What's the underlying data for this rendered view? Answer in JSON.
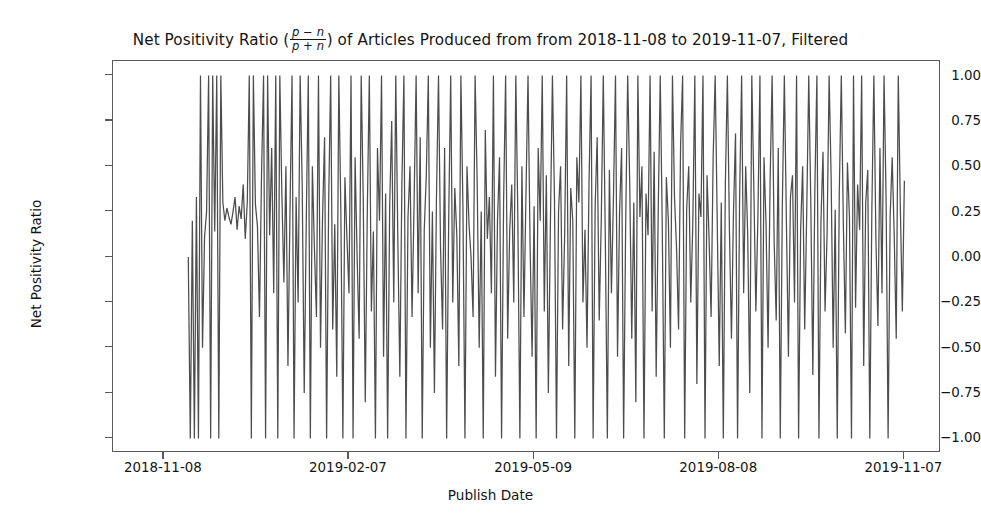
{
  "chart_data": {
    "type": "line",
    "title_prefix": "Net Positivity Ratio (",
    "title_fraction_numerator": "p − n",
    "title_fraction_denominator": "p + n",
    "title_suffix": ") of Articles Produced from from 2018-11-08 to 2019-11-07, Filtered",
    "xlabel": "Publish Date",
    "ylabel": "Net Positivity Ratio",
    "ylim": [
      -1.08,
      1.08
    ],
    "yticks": [
      1.0,
      0.75,
      0.5,
      0.25,
      0.0,
      -0.25,
      -0.5,
      -0.75,
      -1.0
    ],
    "ytick_labels": [
      "1.00",
      "0.75",
      "0.50",
      "0.25",
      "0.00",
      "−0.25",
      "−0.50",
      "−0.75",
      "−1.00"
    ],
    "xticks": [
      0,
      91,
      182,
      273,
      364
    ],
    "xtick_labels": [
      "2018-11-08",
      "2019-02-07",
      "2019-05-09",
      "2019-08-08",
      "2019-11-07"
    ],
    "x_start": "2018-11-08",
    "x_end": "2019-11-07",
    "xlim": [
      -25,
      382
    ],
    "n_points": 365,
    "grid": false,
    "legend": false,
    "line_color": "#4d4d4d",
    "line_width": 1.25,
    "background_color": "#ffffff",
    "axes_edge_color": "#5a5a5a",
    "leading_gap_days": 12,
    "trailing_gap_days": 10,
    "series_name": "Net Positivity Ratio",
    "values": [
      null,
      null,
      null,
      null,
      null,
      null,
      null,
      null,
      null,
      null,
      null,
      null,
      0.0,
      -1.0,
      0.2,
      -1.0,
      0.33,
      -1.0,
      1.0,
      -0.5,
      0.11,
      0.25,
      1.0,
      -1.0,
      1.0,
      0.14,
      1.0,
      -1.0,
      1.0,
      0.3,
      0.2,
      0.27,
      0.22,
      0.18,
      0.25,
      0.33,
      0.15,
      0.28,
      0.21,
      0.4,
      0.1,
      0.3,
      1.0,
      -1.0,
      1.0,
      0.29,
      0.17,
      -0.33,
      0.45,
      1.0,
      -1.0,
      1.0,
      0.12,
      0.6,
      -0.2,
      1.0,
      -1.0,
      1.0,
      0.35,
      -0.14,
      0.5,
      -0.6,
      0.25,
      1.0,
      -1.0,
      0.33,
      -0.25,
      1.0,
      0.4,
      -0.75,
      0.2,
      1.0,
      -1.0,
      0.5,
      0.05,
      -0.33,
      1.0,
      -0.5,
      0.22,
      0.66,
      -1.0,
      0.3,
      1.0,
      -0.4,
      0.18,
      -0.66,
      1.0,
      0.25,
      -1.0,
      0.44,
      0.1,
      -0.2,
      1.0,
      -1.0,
      0.55,
      0.0,
      -0.45,
      1.0,
      0.33,
      -0.8,
      0.25,
      1.0,
      -0.3,
      0.14,
      -1.0,
      0.6,
      0.2,
      1.0,
      -0.55,
      0.35,
      -1.0,
      0.28,
      0.75,
      -0.25,
      1.0,
      0.1,
      -0.66,
      0.4,
      1.0,
      -1.0,
      0.22,
      0.5,
      -0.33,
      0.3,
      1.0,
      -0.2,
      0.66,
      -1.0,
      0.15,
      0.45,
      1.0,
      -0.5,
      0.25,
      -0.75,
      0.33,
      1.0,
      0.05,
      -0.4,
      0.6,
      -1.0,
      0.2,
      1.0,
      -0.25,
      0.38,
      0.12,
      -0.6,
      1.0,
      0.28,
      -1.0,
      0.5,
      0.18,
      0.0,
      -0.33,
      1.0,
      0.42,
      -0.5,
      0.25,
      -1.0,
      0.7,
      0.1,
      0.33,
      -0.2,
      1.0,
      -0.66,
      0.2,
      0.55,
      -1.0,
      0.3,
      1.0,
      -0.45,
      0.15,
      0.4,
      -0.25,
      1.0,
      0.22,
      -1.0,
      0.5,
      -0.33,
      0.35,
      1.0,
      0.08,
      -0.55,
      0.28,
      -1.0,
      0.6,
      0.2,
      1.0,
      -0.3,
      0.45,
      -0.75,
      0.18,
      1.0,
      0.33,
      -1.0,
      0.25,
      0.5,
      -0.4,
      0.12,
      1.0,
      -0.6,
      0.38,
      0.2,
      -1.0,
      0.55,
      0.3,
      1.0,
      -0.25,
      0.15,
      -0.5,
      0.42,
      1.0,
      -1.0,
      0.28,
      0.66,
      -0.35,
      0.2,
      1.0,
      0.1,
      -1.0,
      0.48,
      -0.2,
      0.33,
      1.0,
      -0.55,
      0.25,
      0.6,
      -1.0,
      0.18,
      1.0,
      0.4,
      -0.45,
      0.3,
      -0.8,
      1.0,
      0.22,
      0.5,
      -1.0,
      0.35,
      0.12,
      1.0,
      -0.3,
      0.58,
      -0.66,
      0.25,
      1.0,
      0.15,
      -1.0,
      0.44,
      0.2,
      -0.5,
      1.0,
      0.33,
      0.05,
      -0.4,
      0.62,
      1.0,
      -1.0,
      0.27,
      0.5,
      -0.25,
      0.18,
      1.0,
      -0.7,
      0.35,
      0.22,
      1.0,
      -1.0,
      0.45,
      0.1,
      -0.33,
      0.55,
      1.0,
      0.2,
      -0.6,
      0.3,
      -1.0,
      0.4,
      1.0,
      0.15,
      -0.45,
      0.25,
      0.68,
      -1.0,
      0.32,
      1.0,
      -0.2,
      0.5,
      0.12,
      -0.75,
      1.0,
      0.38,
      -0.3,
      0.22,
      1.0,
      -1.0,
      0.55,
      0.18,
      -0.5,
      0.42,
      1.0,
      0.08,
      -0.35,
      0.6,
      -1.0,
      0.28,
      1.0,
      0.2,
      -0.55,
      0.33,
      0.45,
      -0.25,
      1.0,
      -1.0,
      0.15,
      0.5,
      -0.4,
      0.25,
      1.0,
      0.3,
      -0.65,
      0.38,
      1.0,
      -1.0,
      0.2,
      0.58,
      -0.3,
      0.12,
      1.0,
      0.44,
      -0.5,
      0.26,
      -1.0,
      0.35,
      1.0,
      0.18,
      -0.42,
      0.52,
      0.22,
      -1.0,
      1.0,
      -0.28,
      0.4,
      0.15,
      1.0,
      -0.6,
      0.3,
      0.48,
      -1.0,
      0.25,
      1.0,
      0.1,
      -0.38,
      0.6,
      -0.2,
      1.0,
      0.33,
      -1.0,
      0.22,
      0.55,
      0.12,
      -0.45,
      1.0,
      0.28,
      -0.3,
      0.42,
      null,
      null,
      null,
      null,
      null,
      null,
      null,
      null,
      null,
      null
    ]
  }
}
